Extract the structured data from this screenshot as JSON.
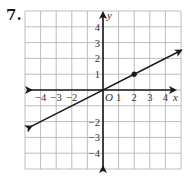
{
  "problem": {
    "number": "7."
  },
  "chart_data": {
    "type": "line",
    "title": "",
    "xlabel": "x",
    "ylabel": "y",
    "origin_label": "O",
    "xlim": [
      -5,
      5
    ],
    "ylim": [
      -5,
      5
    ],
    "grid": true,
    "x_tick_labels": [
      "−4",
      "−3",
      "−2",
      "1",
      "2",
      "3",
      "4"
    ],
    "x_tick_values": [
      -4,
      -3,
      -2,
      1,
      2,
      3,
      4
    ],
    "y_tick_labels": [
      "4",
      "3",
      "2",
      "1",
      "−2",
      "−3",
      "−4"
    ],
    "y_tick_values": [
      4,
      3,
      2,
      1,
      -2,
      -3,
      -4
    ],
    "series": [
      {
        "name": "line",
        "equation": "y = 0.5x",
        "slope": 0.5,
        "intercept": 0,
        "x": [
          -4.6,
          5
        ],
        "y": [
          -2.3,
          2.5
        ],
        "arrows": "both"
      }
    ],
    "points": [
      {
        "x": 2,
        "y": 1,
        "style": "filled-dot"
      }
    ],
    "colors": {
      "grid": "#b5b5b5",
      "axis": "#1a1a1a",
      "line": "#1a1a1a"
    }
  }
}
